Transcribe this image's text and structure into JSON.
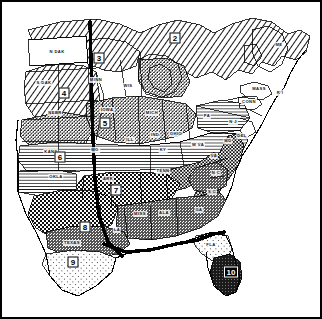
{
  "figure": {
    "kind": "thematic-map",
    "projection_note": "Numbered agro-climatic regions 2 through 10",
    "background_color": "#ffffff",
    "ink_color": "#000000"
  },
  "regions": [
    {
      "id": "2",
      "label": "2",
      "x": 175,
      "y": 38,
      "shape": "w1",
      "style": "outline",
      "fill_pattern": "diagonal-hatch",
      "area_note": "Northern Great Lakes and New England upland"
    },
    {
      "id": "3",
      "label": "3",
      "x": 99,
      "y": 58,
      "shape": "w1",
      "style": "outline",
      "fill_pattern": "diagonal-hatch",
      "area_note": "Northern Minnesota and Wisconsin"
    },
    {
      "id": "4",
      "label": "4",
      "x": 64,
      "y": 93,
      "shape": "w1",
      "style": "outline",
      "fill_pattern": "diagonal-hatch",
      "area_note": "Northern Plains, Dakotas"
    },
    {
      "id": "5",
      "label": "5",
      "x": 105,
      "y": 123,
      "shape": "w1",
      "style": "outline",
      "fill_pattern": "fine-stipple",
      "area_note": "Corn Belt, Iowa to Michigan"
    },
    {
      "id": "6",
      "label": "6",
      "x": 60,
      "y": 157,
      "shape": "w1",
      "style": "outline",
      "fill_pattern": "horizontal-line",
      "area_note": "Central lowland, Kansas to Ohio Valley"
    },
    {
      "id": "7",
      "label": "7",
      "x": 116,
      "y": 190,
      "shape": "w1",
      "style": "outline",
      "fill_pattern": "coarse-crosshatch",
      "area_note": "Ozark and mid-South uplands"
    },
    {
      "id": "8",
      "label": "8",
      "x": 85,
      "y": 227,
      "shape": "w1",
      "style": "outline",
      "fill_pattern": "coarse-crosshatch",
      "area_note": "Southern Plains, Texas and Oklahoma"
    },
    {
      "id": "9",
      "label": "9",
      "x": 73,
      "y": 262,
      "shape": "w1",
      "style": "outline",
      "fill_pattern": "sparse-dot",
      "area_note": "South Texas coastal plain"
    },
    {
      "id": "10",
      "label": "10",
      "x": 231,
      "y": 272,
      "shape": "w2",
      "style": "inverse",
      "fill_pattern": "solid-dark",
      "area_note": "South Florida peninsula"
    }
  ],
  "state_labels": [
    {
      "abbr": "N DAK",
      "x": 57,
      "y": 52
    },
    {
      "abbr": "S DAK",
      "x": 44,
      "y": 83
    },
    {
      "abbr": "NEBR",
      "x": 55,
      "y": 113
    },
    {
      "abbr": "MINN",
      "x": 96,
      "y": 80
    },
    {
      "abbr": "WIS",
      "x": 128,
      "y": 86
    },
    {
      "abbr": "MICH",
      "x": 152,
      "y": 113
    },
    {
      "abbr": "IOWA",
      "x": 107,
      "y": 110
    },
    {
      "abbr": "KANS",
      "x": 51,
      "y": 152
    },
    {
      "abbr": "MO",
      "x": 95,
      "y": 150
    },
    {
      "abbr": "ILL",
      "x": 130,
      "y": 140
    },
    {
      "abbr": "IND",
      "x": 155,
      "y": 135
    },
    {
      "abbr": "OHIO",
      "x": 176,
      "y": 134
    },
    {
      "abbr": "KY",
      "x": 163,
      "y": 150
    },
    {
      "abbr": "W VA",
      "x": 198,
      "y": 145
    },
    {
      "abbr": "PA",
      "x": 207,
      "y": 116
    },
    {
      "abbr": "N J",
      "x": 233,
      "y": 122
    },
    {
      "abbr": "DEL",
      "x": 242,
      "y": 136
    },
    {
      "abbr": "MD",
      "x": 228,
      "y": 141
    },
    {
      "abbr": "VA",
      "x": 214,
      "y": 156
    },
    {
      "abbr": "N C",
      "x": 216,
      "y": 173
    },
    {
      "abbr": "S C",
      "x": 212,
      "y": 192
    },
    {
      "abbr": "GA",
      "x": 199,
      "y": 210
    },
    {
      "abbr": "TENN",
      "x": 163,
      "y": 171
    },
    {
      "abbr": "ARK",
      "x": 108,
      "y": 179
    },
    {
      "abbr": "OKLA",
      "x": 56,
      "y": 177
    },
    {
      "abbr": "TEXAS",
      "x": 72,
      "y": 243
    },
    {
      "abbr": "LA",
      "x": 117,
      "y": 230
    },
    {
      "abbr": "MISS",
      "x": 140,
      "y": 214
    },
    {
      "abbr": "ALA",
      "x": 164,
      "y": 213
    },
    {
      "abbr": "FLA",
      "x": 211,
      "y": 245
    },
    {
      "abbr": "MASS",
      "x": 259,
      "y": 89
    },
    {
      "abbr": "CONN",
      "x": 249,
      "y": 102
    },
    {
      "abbr": "R I",
      "x": 280,
      "y": 93
    },
    {
      "abbr": "ME",
      "x": 279,
      "y": 45
    }
  ],
  "map_features": {
    "meridian_line": {
      "name": "100th-meridian",
      "description": "Thick vertical boundary line running north-south through the Great Plains",
      "thickness_px": 3.2
    },
    "coast_line": {
      "name": "gulf-coast-emphasis",
      "description": "Thick dark line tracing the Gulf coast and north Florida boundary",
      "thickness_px": 3.2
    }
  },
  "patterns": {
    "diagonal_hatch": "diagonal-hatch",
    "fine_stipple": "fine-stipple",
    "horizontal_line": "horizontal-line",
    "coarse_crosshatch": "coarse-crosshatch",
    "sparse_dot": "sparse-dot",
    "solid_dark": "solid-dark"
  }
}
